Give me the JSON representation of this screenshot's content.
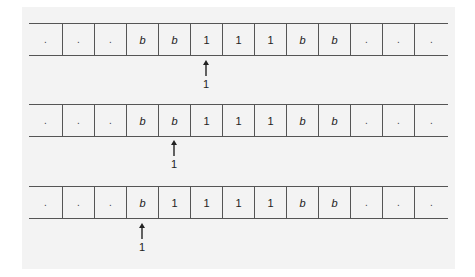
{
  "diagram": {
    "type": "turing-machine-tape-sequence",
    "colors": {
      "background": "#ffffff",
      "panel": "#f3f3f3",
      "lines": "#555555",
      "text": "#222222"
    },
    "tapes": [
      {
        "cells": [
          ".",
          ".",
          ".",
          "b",
          "b",
          "1",
          "1",
          "1",
          "b",
          "b",
          ".",
          ".",
          "."
        ],
        "head_index": 5,
        "head_state": "1"
      },
      {
        "cells": [
          ".",
          ".",
          ".",
          "b",
          "b",
          "1",
          "1",
          "1",
          "b",
          "b",
          ".",
          ".",
          "."
        ],
        "head_index": 4,
        "head_state": "1"
      },
      {
        "cells": [
          ".",
          ".",
          ".",
          "b",
          "1",
          "1",
          "1",
          "1",
          "b",
          "b",
          ".",
          ".",
          "."
        ],
        "head_index": 3,
        "head_state": "1"
      }
    ]
  }
}
